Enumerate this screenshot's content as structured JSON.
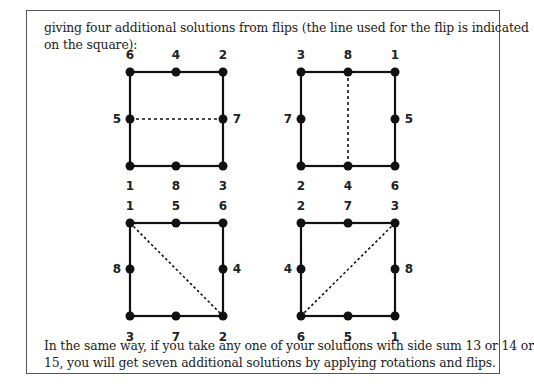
{
  "text": {
    "intro_line1": "giving four additional solutions from flips (the line used for the flip is indicated",
    "intro_line2": "on the square):",
    "outro_line1": "In the same way, if you take any one of your solutions with side sum 13 or 14 or",
    "outro_line2": "15, you will get seven additional solutions by applying rotations and flips."
  },
  "squares": [
    {
      "name": "horizontal-flip",
      "top": [
        "6",
        "4",
        "2"
      ],
      "left": "5",
      "right": "7",
      "bottom": [
        "1",
        "8",
        "3"
      ],
      "flip_line": "horizontal"
    },
    {
      "name": "vertical-flip",
      "top": [
        "3",
        "8",
        "1"
      ],
      "left": "7",
      "right": "5",
      "bottom": [
        "2",
        "4",
        "6"
      ],
      "flip_line": "vertical"
    },
    {
      "name": "diagonal-flip",
      "top": [
        "1",
        "5",
        "6"
      ],
      "left": "8",
      "right": "4",
      "bottom": [
        "3",
        "7",
        "2"
      ],
      "flip_line": "diagonal-main"
    },
    {
      "name": "antidiagonal-flip",
      "top": [
        "2",
        "7",
        "3"
      ],
      "left": "4",
      "right": "8",
      "bottom": [
        "6",
        "5",
        "1"
      ],
      "flip_line": "diagonal-anti"
    }
  ]
}
